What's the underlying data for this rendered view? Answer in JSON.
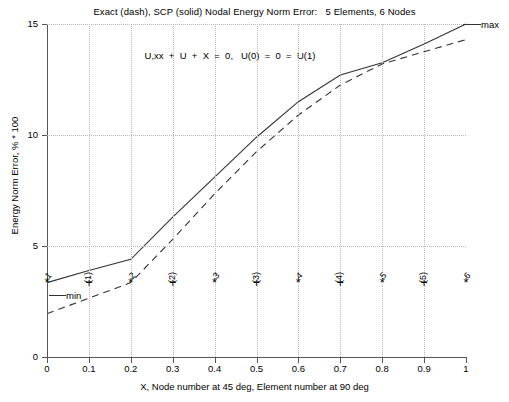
{
  "chart_data": {
    "type": "line",
    "title": "Exact (dash), SCP (solid) Nodal Energy Norm Error:   5 Elements, 6 Nodes",
    "xlabel": "X, Node number at 45 deg, Element number at 90 deg",
    "ylabel": "Energy Norm Error, % * 100",
    "xlim": [
      0,
      1
    ],
    "ylim": [
      0,
      15
    ],
    "grid": true,
    "legend_position": "none",
    "xticks": [
      "0",
      "0.1",
      "0.2",
      "0.3",
      "0.4",
      "0.5",
      "0.6",
      "0.7",
      "0.8",
      "0.9",
      "1"
    ],
    "xtick_values": [
      0,
      0.1,
      0.2,
      0.3,
      0.4,
      0.5,
      0.6,
      0.7,
      0.8,
      0.9,
      1.0
    ],
    "yticks": [
      "0",
      "5",
      "10",
      "15"
    ],
    "ytick_values": [
      0,
      5,
      10,
      15
    ],
    "annotations": [
      {
        "name": "equation",
        "text": "U,xx  +  U  +  X  =  0,   U(0)  =  0  =  U(1)"
      },
      {
        "name": "max",
        "text": "max"
      },
      {
        "name": "min",
        "text": "min"
      }
    ],
    "series": [
      {
        "name": "SCP (solid)",
        "style": "solid",
        "x": [
          0.0,
          0.1,
          0.2,
          0.3,
          0.4,
          0.5,
          0.6,
          0.7,
          0.8,
          0.9,
          1.0
        ],
        "values": [
          3.35,
          3.9,
          4.4,
          6.3,
          8.1,
          9.9,
          11.5,
          12.7,
          13.25,
          14.1,
          15.0
        ]
      },
      {
        "name": "Exact (dash)",
        "style": "dashed",
        "x": [
          0.0,
          0.1,
          0.2,
          0.3,
          0.4,
          0.5,
          0.6,
          0.7,
          0.8,
          0.9,
          1.0
        ],
        "values": [
          1.95,
          2.65,
          3.35,
          5.3,
          7.35,
          9.25,
          10.9,
          12.25,
          13.2,
          13.75,
          14.3
        ]
      }
    ],
    "nodes": {
      "marker": "*",
      "label_rotation_deg": 45,
      "items": [
        {
          "label": "1",
          "x": 0.0
        },
        {
          "label": "2",
          "x": 0.2
        },
        {
          "label": "3",
          "x": 0.4
        },
        {
          "label": "4",
          "x": 0.6
        },
        {
          "label": "5",
          "x": 0.8
        },
        {
          "label": "6",
          "x": 1.0
        }
      ]
    },
    "elements": {
      "marker": "+",
      "label_rotation_deg": 90,
      "items": [
        {
          "label": "(1)",
          "x": 0.1
        },
        {
          "label": "(2)",
          "x": 0.3
        },
        {
          "label": "(3)",
          "x": 0.5
        },
        {
          "label": "(4)",
          "x": 0.7
        },
        {
          "label": "(5)",
          "x": 0.9
        }
      ]
    },
    "marker_row_y": 3.35,
    "colors": {
      "line": "#333333",
      "grid": "#b9b9b9",
      "axis": "#555555",
      "text": "#000000",
      "background": "#ffffff"
    }
  }
}
